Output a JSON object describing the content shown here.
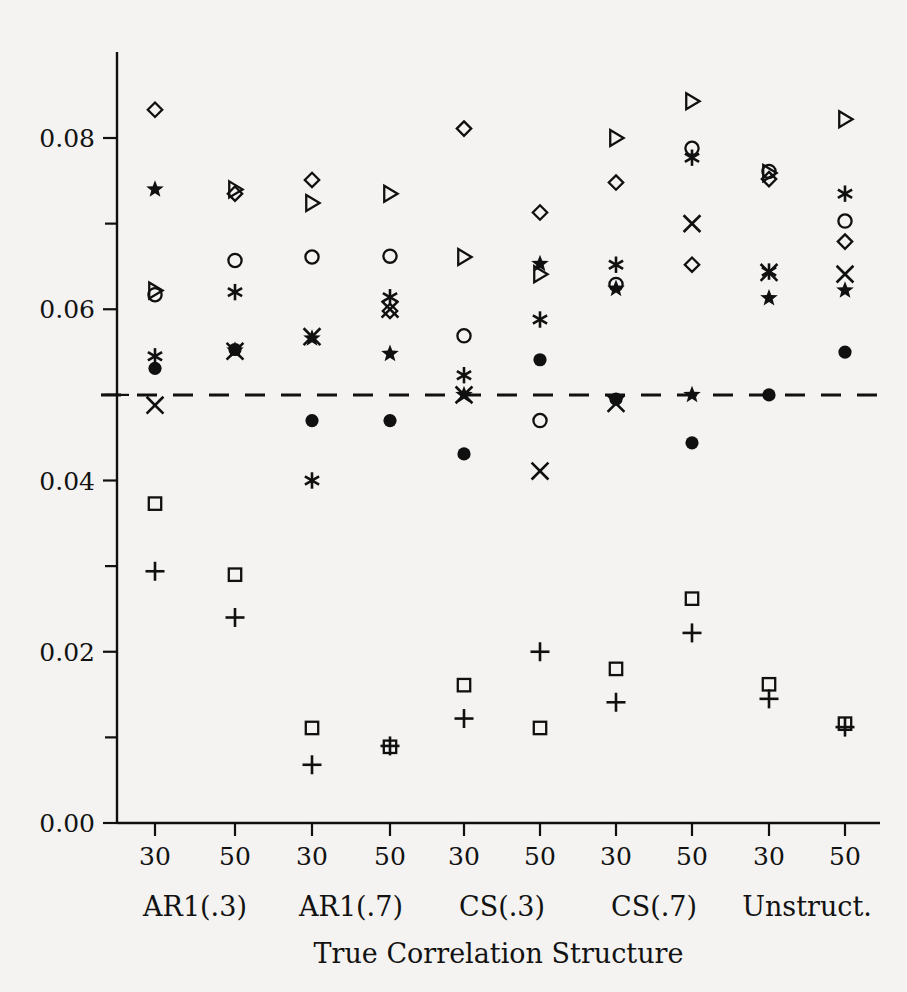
{
  "figure": {
    "background_color": "#f4f3f1",
    "ink_color": "#101010"
  },
  "axes": {
    "y_ticks_labeled": [
      "0.00",
      "0.02",
      "0.04",
      "0.06",
      "0.08"
    ],
    "y_tick_values": [
      0.0,
      0.02,
      0.04,
      0.06,
      0.08
    ],
    "y_minor_tick_values": [
      0.01,
      0.03,
      0.05,
      0.07
    ],
    "y_range": [
      0.0,
      0.0885
    ],
    "x_title": "True Correlation Structure",
    "x_tick_labels": [
      "30",
      "50",
      "30",
      "50",
      "30",
      "50",
      "30",
      "50",
      "30",
      "50"
    ],
    "group_labels": [
      "AR1(.3)",
      "AR1(.7)",
      "CS(.3)",
      "CS(.7)",
      "Unstruct."
    ],
    "reference_line_value": 0.05,
    "reference_line_style": "dashed"
  },
  "chart_data": {
    "type": "scatter",
    "title": "",
    "xlabel": "True Correlation Structure",
    "ylabel": "",
    "ylim": [
      0.0,
      0.0885
    ],
    "grid": false,
    "legend": "none",
    "reference_line": 0.05,
    "categories": [
      "AR1(.3) n=30",
      "AR1(.3) n=50",
      "AR1(.7) n=30",
      "AR1(.7) n=50",
      "CS(.3) n=30",
      "CS(.3) n=50",
      "CS(.7) n=30",
      "CS(.7) n=50",
      "Unstruct. n=30",
      "Unstruct. n=50"
    ],
    "series": [
      {
        "name": "diamond",
        "marker": "diamond",
        "values": [
          0.0833,
          0.0735,
          0.0751,
          0.0598,
          0.0811,
          0.0713,
          0.0748,
          0.0652,
          0.0752,
          0.0679
        ]
      },
      {
        "name": "triangle",
        "marker": "triangle",
        "values": [
          0.0622,
          0.074,
          0.0724,
          0.0735,
          0.0661,
          0.0641,
          0.08,
          0.0843,
          0.0759,
          0.0822
        ]
      },
      {
        "name": "circle",
        "marker": "circle",
        "values": [
          0.0617,
          0.0657,
          0.0661,
          0.0662,
          0.0569,
          0.047,
          0.0629,
          0.0788,
          0.0761,
          0.0703
        ]
      },
      {
        "name": "star",
        "marker": "star",
        "values": [
          0.074,
          0.0552,
          0.0566,
          0.0548,
          0.05,
          0.0653,
          0.0624,
          0.05,
          0.0613,
          0.0622
        ]
      },
      {
        "name": "asterisk",
        "marker": "asterisk",
        "values": [
          0.0545,
          0.062,
          0.04,
          0.0614,
          0.0523,
          0.0588,
          0.0652,
          0.0777,
          0.0644,
          0.0735
        ]
      },
      {
        "name": "cross-x",
        "marker": "cross-x",
        "values": [
          0.0488,
          0.0551,
          0.0568,
          0.06,
          0.05,
          0.0411,
          0.049,
          0.07,
          0.0643,
          0.0641
        ]
      },
      {
        "name": "filled-circle",
        "marker": "filled-circle",
        "values": [
          0.0531,
          0.0553,
          0.047,
          0.047,
          0.0431,
          0.0541,
          0.0495,
          0.0444,
          0.05,
          0.055
        ]
      },
      {
        "name": "square",
        "marker": "square",
        "values": [
          0.0373,
          0.029,
          0.0111,
          0.0089,
          0.0161,
          0.0111,
          0.018,
          0.0262,
          0.0162,
          0.0116
        ]
      },
      {
        "name": "plus",
        "marker": "plus",
        "values": [
          0.0294,
          0.024,
          0.0068,
          0.009,
          0.0122,
          0.02,
          0.0141,
          0.0222,
          0.0145,
          0.0112
        ]
      }
    ]
  }
}
